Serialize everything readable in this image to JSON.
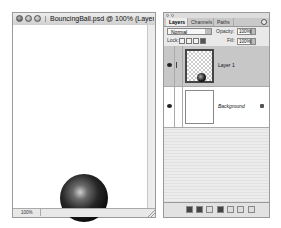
{
  "document_window": {
    "title": "BouncingBall.psd @ 100% (Layer",
    "zoom_level": "100%",
    "buttons": [
      "close",
      "minimize",
      "zoom"
    ]
  },
  "layers_panel": {
    "tabs": [
      {
        "label": "Layers",
        "active": true
      },
      {
        "label": "Channels",
        "active": false
      },
      {
        "label": "Paths",
        "active": false
      }
    ],
    "blend_mode": "Normal",
    "opacity_label": "Opacity:",
    "opacity_value": "100%",
    "lock_label": "Lock:",
    "fill_label": "Fill:",
    "fill_value": "100%",
    "layers": [
      {
        "name": "Layer 1",
        "visible": true,
        "selected": true,
        "locked": false
      },
      {
        "name": "Background",
        "visible": true,
        "selected": false,
        "locked": true
      }
    ],
    "bottom_buttons": [
      "link-layers",
      "add-layer-style",
      "add-mask",
      "new-adjustment-layer",
      "new-group",
      "new-layer",
      "delete-layer"
    ]
  }
}
